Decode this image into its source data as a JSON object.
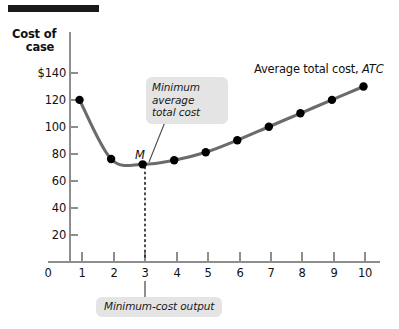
{
  "figure": {
    "axis_title_y_line1": "Cost of",
    "axis_title_y_line2": "case",
    "axis_title_x": "Quantity of salsa (cases)",
    "series_label_text": "Average total cost, ",
    "series_label_abbr": "ATC",
    "point_label": "M",
    "callout_min_atc": "Minimum average total cost",
    "callout_min_atc_lines": [
      "Minimum",
      "average",
      "total cost"
    ],
    "callout_min_output": "Minimum-cost output"
  },
  "colors": {
    "curve": "#6b6b6b",
    "point": "#000000",
    "axis": "#8e8e8e",
    "callout_bg": "#e4e4e4",
    "rule": "#2b2b2b",
    "text": "#111111"
  },
  "chart_data": {
    "type": "line",
    "title": "",
    "xlabel": "Quantity of salsa (cases)",
    "ylabel": "Cost of case",
    "xlim": [
      0,
      10.6
    ],
    "ylim": [
      0,
      150
    ],
    "grid": false,
    "legend": "inline-label",
    "x": [
      1,
      2,
      3,
      4,
      5,
      6,
      7,
      8,
      9,
      10
    ],
    "values": [
      120,
      76,
      72,
      75,
      81,
      90,
      100,
      110,
      120,
      130
    ],
    "series": [
      {
        "name": "Average total cost, ATC",
        "values": [
          120,
          76,
          72,
          75,
          81,
          90,
          100,
          110,
          120,
          130
        ]
      }
    ],
    "ytick_labels": [
      "$140",
      "120",
      "100",
      "80",
      "60",
      "40",
      "20"
    ],
    "ytick_values": [
      140,
      120,
      100,
      80,
      60,
      40,
      20
    ],
    "xtick_labels": [
      "0",
      "1",
      "2",
      "3",
      "4",
      "5",
      "6",
      "7",
      "8",
      "9",
      "10"
    ],
    "xtick_values": [
      0,
      1,
      2,
      3,
      4,
      5,
      6,
      7,
      8,
      9,
      10
    ],
    "annotations": [
      {
        "label": "M",
        "text": "Minimum average total cost",
        "x": 3,
        "y": 72
      },
      {
        "label": "Minimum-cost output",
        "x": 3,
        "y": 0
      }
    ]
  }
}
